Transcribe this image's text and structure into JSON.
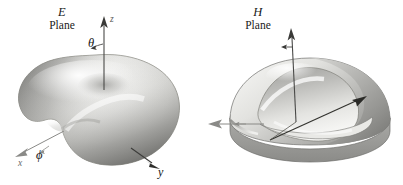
{
  "figure": {
    "kind": "antenna-radiation-pattern-diagram",
    "background_color": "#ffffff",
    "width": 403,
    "height": 185,
    "panels": [
      {
        "id": "e-plane",
        "title_symbol": "E",
        "title_word": "Plane",
        "pattern": {
          "name": "toroidal-donut-lobe",
          "description": "three-dimensional donut shaped radiation lobe with central dimple, shaded light grey with dark left and lower-right edges",
          "fill_light": "#f2f2f0",
          "fill_mid": "#c9c9c6",
          "fill_dark": "#8a8a87",
          "outline_color": "#6e6e6b"
        },
        "axes": [
          {
            "name": "z-axis",
            "label": "z",
            "direction": "up",
            "arrow": true
          },
          {
            "name": "theta-angle",
            "label": "θ",
            "arrow": "curved"
          },
          {
            "name": "x-axis",
            "label": "x",
            "direction": "down-left",
            "arrow": true
          },
          {
            "name": "phi-angle",
            "label": "ϕ",
            "arrow": "curved"
          },
          {
            "name": "y-axis",
            "label": "y",
            "direction": "down-right",
            "arrow": true
          }
        ]
      },
      {
        "id": "h-plane",
        "title_symbol": "H",
        "title_word": "Plane",
        "pattern": {
          "name": "sliced-dome-lobe",
          "description": "three-dimensional dome shaped radiation lobe sliced open revealing an inner flat cut plane and a grey cylindrical base",
          "fill_light": "#eeeeec",
          "fill_mid": "#bcbcb9",
          "fill_dark": "#7e7e7b",
          "outline_color": "#6e6e6b"
        },
        "axes": [
          {
            "name": "z-axis",
            "label": "z",
            "direction": "up",
            "arrow": true
          },
          {
            "name": "theta-angle",
            "label": "θ",
            "arrow": "straight"
          },
          {
            "name": "x-axis",
            "label": "x",
            "direction": "left",
            "arrow": true
          },
          {
            "name": "phi-angle",
            "label": "ϕ",
            "arrow": "curved"
          },
          {
            "name": "y-axis",
            "label": "y",
            "direction": "up-right",
            "arrow": true
          }
        ]
      }
    ]
  }
}
